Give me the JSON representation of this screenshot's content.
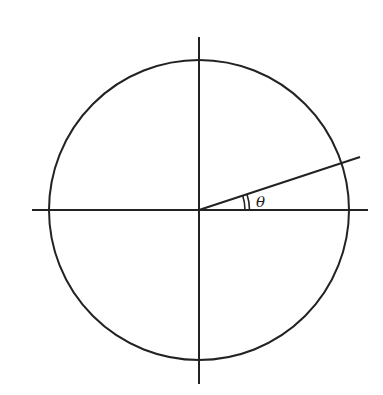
{
  "diagram": {
    "stroke_color": "#222222",
    "background": "#ffffff",
    "circle": {
      "cx": 199,
      "cy": 210,
      "r": 150
    },
    "axes": {
      "horizontal": {
        "x1": 32,
        "y1": 210,
        "x2": 368,
        "y2": 210
      },
      "vertical": {
        "x1": 199,
        "y1": 37,
        "x2": 199,
        "y2": 384
      }
    },
    "radial_line": {
      "x1": 199,
      "y1": 210,
      "x2": 360,
      "y2": 157
    },
    "angle": {
      "label": "θ",
      "label_x": 256,
      "label_y": 207,
      "arc_radii": [
        46,
        50
      ]
    }
  }
}
